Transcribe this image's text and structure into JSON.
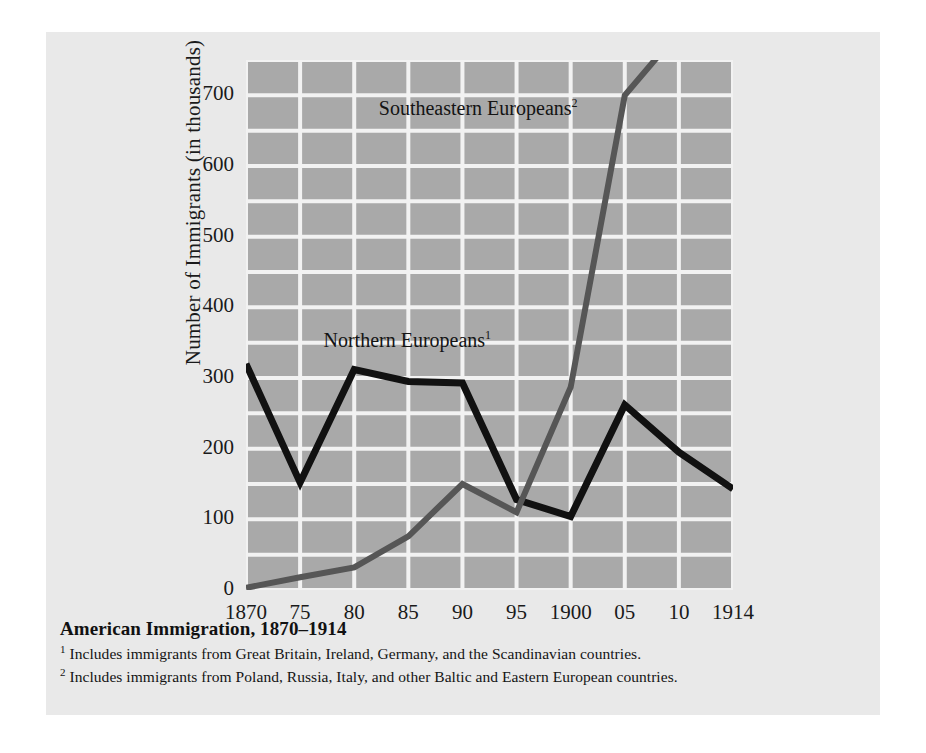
{
  "chart_data": {
    "type": "line",
    "title": "American Immigration, 1870–1914",
    "xlabel": "",
    "ylabel": "Number of Immigrants (in thousands)",
    "x": [
      1870,
      1875,
      1880,
      1885,
      1890,
      1895,
      1900,
      1905,
      1910,
      1914
    ],
    "categories": [
      "1870",
      "75",
      "80",
      "85",
      "90",
      "95",
      "1900",
      "05",
      "10",
      "1914"
    ],
    "ylim": [
      0,
      750
    ],
    "yticks": [
      0,
      100,
      200,
      300,
      400,
      500,
      600,
      700
    ],
    "ytick_labels": [
      "0",
      "100",
      "200",
      "300",
      "400",
      "500",
      "600",
      "700"
    ],
    "grid": "major and minor horizontal every 50, vertical at each tick",
    "legend_position": "inline annotations on plot",
    "series": [
      {
        "name": "Northern Europeans",
        "footnote_marker": "1",
        "color": "#111111",
        "values": [
          320,
          152,
          312,
          295,
          293,
          128,
          104,
          262,
          195,
          143
        ]
      },
      {
        "name": "Southeastern Europeans",
        "footnote_marker": "2",
        "color": "#565656",
        "note": "line is clipped at the top of the plot area above 750",
        "values": [
          3,
          18,
          32,
          76,
          150,
          110,
          287,
          700,
          790,
          860
        ]
      }
    ],
    "annotations": [
      {
        "text": "Southeastern Europeans",
        "marker": "2",
        "x": 1882,
        "y": 680
      },
      {
        "text": "Northern Europeans",
        "marker": "1",
        "x": 1877,
        "y": 352
      }
    ]
  },
  "caption": {
    "title": "American Immigration, 1870–1914",
    "footnotes": [
      {
        "marker": "1",
        "text": "Includes immigrants from Great Britain, Ireland, Germany, and the Scandinavian countries."
      },
      {
        "marker": "2",
        "text": "Includes immigrants from Poland, Russia, Italy, and other Baltic and Eastern European countries."
      }
    ]
  },
  "colors": {
    "page_background": "#ffffff",
    "card_background": "#e9e9e9",
    "plot_background": "#a9a9a9",
    "gridline": "#f2f2f2",
    "northern_line": "#111111",
    "southeastern_line": "#565656",
    "text": "#1a1a1a"
  }
}
